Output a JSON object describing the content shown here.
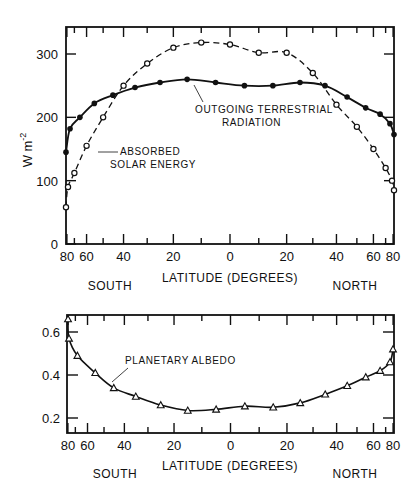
{
  "chart_data": [
    {
      "type": "line",
      "title": "",
      "xlabel": "LATITUDE (DEGREES)",
      "ylabel": "W m-2",
      "x_scale": "sine of latitude",
      "x": [
        -80,
        -70,
        -60,
        -50,
        -40,
        -30,
        -20,
        -10,
        0,
        10,
        20,
        30,
        40,
        50,
        60,
        70,
        80
      ],
      "x_tick_labels": [
        "80",
        "60",
        "40",
        "20",
        "0",
        "20",
        "40",
        "60",
        "80"
      ],
      "x_tick_values": [
        -80,
        -60,
        -40,
        -20,
        0,
        20,
        40,
        60,
        80
      ],
      "hemisphere_labels": {
        "left": "SOUTH",
        "right": "NORTH"
      },
      "ylim": [
        0,
        340
      ],
      "y_ticks": [
        0,
        100,
        200,
        300
      ],
      "series": [
        {
          "name": "OUTGOING TERRESTRIAL RADIATION",
          "style": "solid line, filled circles",
          "x": [
            -82,
            -75,
            -65,
            -55,
            -45,
            -35,
            -25,
            -15,
            -5,
            5,
            15,
            25,
            35,
            45,
            55,
            65,
            75,
            82
          ],
          "values": [
            145,
            182,
            200,
            222,
            235,
            247,
            255,
            260,
            255,
            250,
            250,
            255,
            250,
            232,
            215,
            205,
            190,
            173
          ]
        },
        {
          "name": "ABSORBED SOLAR ENERGY",
          "style": "dashed line, open circles",
          "x": [
            -82,
            -78,
            -70,
            -60,
            -50,
            -40,
            -30,
            -20,
            -10,
            0,
            10,
            20,
            30,
            40,
            50,
            60,
            70,
            78,
            82
          ],
          "values": [
            58,
            90,
            112,
            155,
            200,
            250,
            285,
            310,
            318,
            315,
            302,
            302,
            270,
            220,
            185,
            150,
            120,
            100,
            85
          ]
        }
      ],
      "annotations": [
        "ABSORBED SOLAR ENERGY",
        "OUTGOING TERRESTRIAL RADIATION"
      ],
      "grid": false,
      "legend": "inline annotations"
    },
    {
      "type": "line",
      "title": "",
      "xlabel": "LATITUDE (DEGREES)",
      "ylabel": "",
      "x_scale": "sine of latitude",
      "x_tick_labels": [
        "80",
        "60",
        "40",
        "20",
        "0",
        "20",
        "40",
        "60",
        "80"
      ],
      "x_tick_values": [
        -80,
        -60,
        -40,
        -20,
        0,
        20,
        40,
        60,
        80
      ],
      "hemisphere_labels": {
        "left": "SOUTH",
        "right": "NORTH"
      },
      "ylim": [
        0.13,
        0.68
      ],
      "y_ticks": [
        0.2,
        0.4,
        0.6
      ],
      "series": [
        {
          "name": "PLANETARY ALBEDO",
          "style": "solid line, open triangles",
          "x": [
            -85,
            -78,
            -68,
            -55,
            -45,
            -35,
            -25,
            -15,
            -5,
            5,
            15,
            25,
            35,
            45,
            55,
            65,
            75,
            82
          ],
          "values": [
            0.66,
            0.57,
            0.49,
            0.41,
            0.34,
            0.3,
            0.26,
            0.235,
            0.24,
            0.255,
            0.25,
            0.27,
            0.31,
            0.35,
            0.39,
            0.42,
            0.46,
            0.52
          ]
        }
      ],
      "annotations": [
        "PLANETARY ALBEDO"
      ],
      "grid": false,
      "legend": "inline annotation"
    }
  ],
  "top": {
    "ylabel": "W m",
    "ylabel_sup": "-2",
    "y_tick_labels": [
      "0",
      "100",
      "200",
      "300"
    ],
    "x_tick_labels": [
      "80",
      "60",
      "40",
      "20",
      "0",
      "20",
      "40",
      "60",
      "80"
    ],
    "xlabel": "LATITUDE (DEGREES)",
    "south": "SOUTH",
    "north": "NORTH",
    "anno_absorbed_1": "ABSORBED",
    "anno_absorbed_2": "SOLAR ENERGY",
    "anno_outgoing_1": "OUTGOING TERRESTRIAL",
    "anno_outgoing_2": "RADIATION"
  },
  "bottom": {
    "y_tick_labels": [
      "0.2",
      "0.4",
      "0.6"
    ],
    "x_tick_labels": [
      "80",
      "60",
      "40",
      "20",
      "0",
      "20",
      "40",
      "60",
      "80"
    ],
    "xlabel": "LATITUDE (DEGREES)",
    "south": "SOUTH",
    "north": "NORTH",
    "anno_albedo": "PLANETARY ALBEDO"
  }
}
